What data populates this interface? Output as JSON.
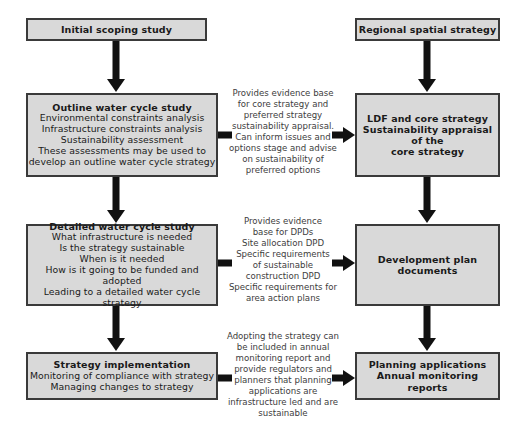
{
  "diagram": {
    "colors": {
      "box_fill": "#d9d9d9",
      "box_border": "#3a3a3a",
      "arrow": "#111111",
      "note_text": "#3d3d3d",
      "background": "#ffffff"
    },
    "left_column": [
      {
        "id": "initial-scoping-study",
        "title": "Initial scoping study",
        "lines": []
      },
      {
        "id": "outline-water-cycle-study",
        "title": "Outline water cycle study",
        "lines": [
          "Environmental constraints analysis",
          "Infrastructure constraints analysis",
          "Sustainability assessment",
          "These assessments may be used to",
          "develop an outline water cycle strategy"
        ]
      },
      {
        "id": "detailed-water-cycle-study",
        "title": "Detailed water cycle study",
        "lines": [
          "What infrastructure is needed",
          "Is the strategy sustainable",
          "When is it needed",
          "How is it going to be funded and adopted",
          "Leading to a detailed water cycle strategy"
        ]
      },
      {
        "id": "strategy-implementation",
        "title": "Strategy implementation",
        "lines": [
          "Monitoring of compliance with strategy",
          "Managing changes to strategy"
        ]
      }
    ],
    "right_column": [
      {
        "id": "regional-spatial-strategy",
        "title": "Regional spatial strategy",
        "lines": []
      },
      {
        "id": "ldf-and-core-strategy",
        "title": "LDF and core strategy",
        "lines": [
          "Sustainability appraisal of the",
          "core strategy"
        ]
      },
      {
        "id": "development-plan-documents",
        "title": "Development plan documents",
        "lines": []
      },
      {
        "id": "planning-applications",
        "title": "Planning applications",
        "lines": [
          "Annual monitoring reports"
        ]
      }
    ],
    "notes": [
      {
        "id": "note-core-strategy",
        "lines": [
          "Provides evidence base",
          "for core strategy and",
          "preferred strategy",
          "sustainability appraisal.",
          "Can inform issues and",
          "options stage and advise",
          "on sustainability of",
          "preferred options"
        ]
      },
      {
        "id": "note-dpds",
        "lines": [
          "Provides evidence",
          "base for DPDs",
          "Site allocation DPD",
          "Specific requirements",
          "of sustainable",
          "construction DPD",
          "Specific requirements for",
          "area action plans"
        ]
      },
      {
        "id": "note-monitoring",
        "lines": [
          "Adopting the strategy can",
          "be included in annual",
          "monitoring report and",
          "provide regulators and",
          "planners that planning",
          "applications are",
          "infrastructure led and are",
          "sustainable"
        ]
      }
    ]
  }
}
